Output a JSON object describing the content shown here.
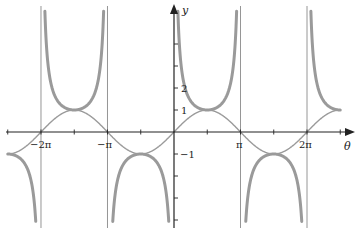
{
  "chart_data": {
    "type": "line",
    "title": "",
    "xlabel": "θ",
    "ylabel": "y",
    "xlim": [
      -7.85,
      7.85
    ],
    "ylim": [
      -4.3,
      5.3
    ],
    "grid": false,
    "legend": null,
    "x_ticks": [
      {
        "value": -6.2832,
        "label": "−2π"
      },
      {
        "value": -3.1416,
        "label": "−π"
      },
      {
        "value": 3.1416,
        "label": "π"
      },
      {
        "value": 6.2832,
        "label": "2π"
      }
    ],
    "x_minor_ticks": [
      -7.854,
      -4.712,
      -1.571,
      1.571,
      4.712,
      7.854
    ],
    "y_ticks": [
      {
        "value": 1,
        "label": "1"
      },
      {
        "value": 2,
        "label": "2"
      },
      {
        "value": -1,
        "label": "−1"
      }
    ],
    "y_unlabeled_ticks": [
      3,
      4,
      -2,
      -3,
      -4
    ],
    "asymptotes": [
      -6.2832,
      -3.1416,
      0,
      3.1416,
      6.2832
    ],
    "series": [
      {
        "name": "y = sin θ",
        "style": "thin",
        "function": "sin",
        "x_range": [
          -7.854,
          7.854
        ]
      },
      {
        "name": "y = csc θ",
        "style": "thick",
        "function": "csc",
        "x_range": [
          -7.854,
          7.854
        ]
      }
    ],
    "colors": {
      "curve": "#9a9a9a",
      "axis": "#222222",
      "asymptote": "#8a8a8a"
    }
  },
  "labels": {
    "x_axis": "θ",
    "y_axis": "y",
    "xt_m2pi": "−2π",
    "xt_mpi": "−π",
    "xt_pi": "π",
    "xt_2pi": "2π",
    "yt_1": "1",
    "yt_2": "2",
    "yt_m1": "−1"
  }
}
